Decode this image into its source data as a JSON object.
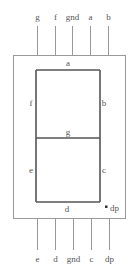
{
  "diagram": {
    "top_pins": [
      "g",
      "f",
      "gnd",
      "a",
      "b"
    ],
    "bottom_pins": [
      "e",
      "d",
      "gnd",
      "c",
      "dp"
    ],
    "segments": {
      "a": "a",
      "b": "b",
      "c": "c",
      "d": "d",
      "e": "e",
      "f": "f",
      "g": "g",
      "dp": "dp"
    },
    "colors": {
      "outline": "#888888",
      "segment": "#555555",
      "text": "#555555"
    }
  }
}
